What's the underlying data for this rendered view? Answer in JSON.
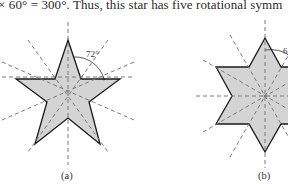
{
  "body_text": "× 60° = 300°. Thus, this star has five rotational symm",
  "figures": [
    {
      "id": "a",
      "caption": "(a)",
      "shape": "five-pointed star",
      "points": 5,
      "fill_color": "#d4d4d4",
      "stroke_color": "#1a1a1a",
      "axis_color": "#7a7a7a",
      "angle_label": "72°"
    },
    {
      "id": "b",
      "caption": "(b)",
      "shape": "six-pointed star",
      "points": 6,
      "fill_color": "#d4d4d4",
      "stroke_color": "#1a1a1a",
      "axis_color": "#7a7a7a",
      "angle_label": "6"
    }
  ]
}
